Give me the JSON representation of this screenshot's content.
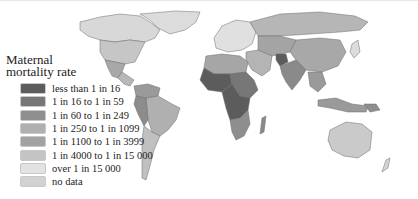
{
  "map": {
    "type": "choropleth world map",
    "colors": {
      "c1": "#5c5c5c",
      "c2": "#777777",
      "c3": "#8f8f8f",
      "c4": "#a9a9a9",
      "c5": "#a0a0a0",
      "c6": "#c2c2c2",
      "c7": "#dedede",
      "nodata": "#d4d4d4"
    }
  },
  "legend": {
    "title_line1": "Maternal",
    "title_line2": "mortality rate",
    "items": [
      {
        "label": "less than 1 in 16",
        "color": "#5c5c5c"
      },
      {
        "label": "1 in 16 to 1 in 59",
        "color": "#777777"
      },
      {
        "label": "1 in 60 to 1 in 249",
        "color": "#8f8f8f"
      },
      {
        "label": "1 in 250 to 1 in 1099",
        "color": "#b0b0b0"
      },
      {
        "label": "1 in 1100 to 1 in 3999",
        "color": "#a2a2a2"
      },
      {
        "label": "1 in 4000 to 1 in 15 000",
        "color": "#c4c4c4"
      },
      {
        "label": "over 1 in 15 000",
        "color": "#e2e2e2"
      },
      {
        "label": "no data",
        "color": "#d2d2d2"
      }
    ]
  }
}
